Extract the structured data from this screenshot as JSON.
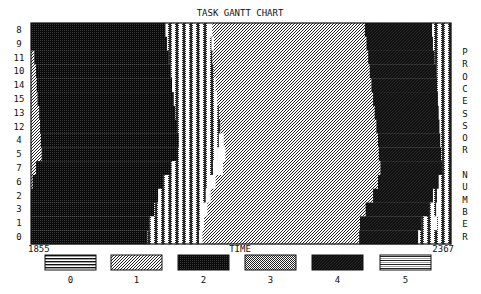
{
  "chart_data": {
    "type": "gantt",
    "title": "TASK GANTT CHART",
    "xlabel": "TIME",
    "ylabel": "PROCESSOR NUMBER",
    "xlim": [
      1855,
      2367
    ],
    "x_tick_labels": [
      "1855",
      "2367"
    ],
    "grid": false,
    "legend_position": "bottom",
    "legend": [
      {
        "task_type": "0",
        "pattern": "horizontal-lines"
      },
      {
        "task_type": "1",
        "pattern": "diagonal-light"
      },
      {
        "task_type": "2",
        "pattern": "dense-dark-checker"
      },
      {
        "task_type": "3",
        "pattern": "stipple-dots"
      },
      {
        "task_type": "4",
        "pattern": "dense-dark-diagonal"
      },
      {
        "task_type": "5",
        "pattern": "double-horizontal-lines"
      }
    ],
    "rows": [
      {
        "processor": "8",
        "segments": [
          [
            1855,
            2019,
            "2"
          ],
          [
            2019,
            2073,
            "3"
          ],
          [
            2073,
            2076,
            "gap"
          ],
          [
            2076,
            2262,
            "1"
          ],
          [
            2262,
            2344,
            "4"
          ],
          [
            2344,
            2367,
            "3"
          ]
        ]
      },
      {
        "processor": "9",
        "segments": [
          [
            1855,
            2021,
            "2"
          ],
          [
            2021,
            2075,
            "3"
          ],
          [
            2075,
            2078,
            "gap"
          ],
          [
            2078,
            2264,
            "1"
          ],
          [
            2264,
            2345,
            "4"
          ],
          [
            2345,
            2367,
            "3"
          ]
        ]
      },
      {
        "processor": "11",
        "segments": [
          [
            1855,
            1859,
            "1"
          ],
          [
            1859,
            2023,
            "2"
          ],
          [
            2023,
            2076,
            "3"
          ],
          [
            2076,
            2266,
            "1"
          ],
          [
            2266,
            2347,
            "4"
          ],
          [
            2347,
            2367,
            "3"
          ]
        ]
      },
      {
        "processor": "10",
        "segments": [
          [
            1855,
            1861,
            "1"
          ],
          [
            1861,
            2025,
            "2"
          ],
          [
            2025,
            2078,
            "3"
          ],
          [
            2078,
            2268,
            "1"
          ],
          [
            2268,
            2349,
            "4"
          ],
          [
            2349,
            2367,
            "3"
          ]
        ]
      },
      {
        "processor": "14",
        "segments": [
          [
            1855,
            1862,
            "1"
          ],
          [
            1862,
            2027,
            "2"
          ],
          [
            2027,
            2080,
            "3"
          ],
          [
            2080,
            2270,
            "1"
          ],
          [
            2270,
            2350,
            "4"
          ],
          [
            2350,
            2367,
            "3"
          ]
        ]
      },
      {
        "processor": "15",
        "segments": [
          [
            1855,
            1863,
            "1"
          ],
          [
            1863,
            2029,
            "2"
          ],
          [
            2029,
            2082,
            "3"
          ],
          [
            2082,
            2272,
            "1"
          ],
          [
            2272,
            2351,
            "4"
          ],
          [
            2351,
            2367,
            "3"
          ]
        ]
      },
      {
        "processor": "13",
        "segments": [
          [
            1855,
            1865,
            "1"
          ],
          [
            1865,
            2031,
            "2"
          ],
          [
            2031,
            2084,
            "3"
          ],
          [
            2084,
            2274,
            "1"
          ],
          [
            2274,
            2352,
            "4"
          ],
          [
            2352,
            2367,
            "3"
          ]
        ]
      },
      {
        "processor": "12",
        "segments": [
          [
            1855,
            1866,
            "1"
          ],
          [
            1866,
            2033,
            "2"
          ],
          [
            2033,
            2086,
            "3"
          ],
          [
            2086,
            2276,
            "1"
          ],
          [
            2276,
            2353,
            "4"
          ],
          [
            2353,
            2367,
            "3"
          ]
        ]
      },
      {
        "processor": "4",
        "segments": [
          [
            1855,
            1867,
            "1"
          ],
          [
            1867,
            2035,
            "2"
          ],
          [
            2035,
            2084,
            "3"
          ],
          [
            2084,
            2090,
            "gap"
          ],
          [
            2090,
            2278,
            "1"
          ],
          [
            2278,
            2354,
            "4"
          ],
          [
            2354,
            2367,
            "3"
          ]
        ]
      },
      {
        "processor": "5",
        "segments": [
          [
            1855,
            1868,
            "1"
          ],
          [
            1868,
            2034,
            "2"
          ],
          [
            2034,
            2082,
            "3"
          ],
          [
            2082,
            2092,
            "gap"
          ],
          [
            2092,
            2279,
            "1"
          ],
          [
            2279,
            2355,
            "4"
          ],
          [
            2355,
            2367,
            "3"
          ]
        ]
      },
      {
        "processor": "7",
        "segments": [
          [
            1855,
            1861,
            "1"
          ],
          [
            1861,
            2026,
            "2"
          ],
          [
            2026,
            2077,
            "3"
          ],
          [
            2077,
            2089,
            "gap"
          ],
          [
            2089,
            2281,
            "1"
          ],
          [
            2281,
            2356,
            "4"
          ],
          [
            2356,
            2367,
            "3"
          ]
        ]
      },
      {
        "processor": "6",
        "segments": [
          [
            1855,
            1857,
            "1"
          ],
          [
            1857,
            2016,
            "2"
          ],
          [
            2016,
            2072,
            "3"
          ],
          [
            2072,
            2080,
            "gap"
          ],
          [
            2080,
            2278,
            "1"
          ],
          [
            2278,
            2352,
            "4"
          ],
          [
            2352,
            2367,
            "3"
          ]
        ]
      },
      {
        "processor": "2",
        "segments": [
          [
            1855,
            2010,
            "2"
          ],
          [
            2010,
            2068,
            "3"
          ],
          [
            2068,
            2074,
            "gap"
          ],
          [
            2074,
            2272,
            "1"
          ],
          [
            2272,
            2345,
            "4"
          ],
          [
            2345,
            2350,
            "3"
          ],
          [
            2350,
            2355,
            "gap"
          ],
          [
            2355,
            2367,
            "3"
          ]
        ]
      },
      {
        "processor": "3",
        "segments": [
          [
            1855,
            2005,
            "2"
          ],
          [
            2005,
            2064,
            "3"
          ],
          [
            2064,
            2070,
            "gap"
          ],
          [
            2070,
            2263,
            "1"
          ],
          [
            2263,
            2340,
            "4"
          ],
          [
            2340,
            2349,
            "3"
          ],
          [
            2349,
            2354,
            "gap"
          ],
          [
            2354,
            2367,
            "3"
          ]
        ]
      },
      {
        "processor": "1",
        "segments": [
          [
            1855,
            1999,
            "2"
          ],
          [
            1999,
            2062,
            "3"
          ],
          [
            2062,
            2066,
            "gap"
          ],
          [
            2066,
            2256,
            "1"
          ],
          [
            2256,
            2331,
            "4"
          ],
          [
            2331,
            2345,
            "3"
          ],
          [
            2345,
            2350,
            "gap"
          ],
          [
            2350,
            2367,
            "3"
          ]
        ]
      },
      {
        "processor": "0",
        "segments": [
          [
            1855,
            1997,
            "2"
          ],
          [
            1997,
            2060,
            "3"
          ],
          [
            2060,
            2064,
            "gap"
          ],
          [
            2064,
            2255,
            "1"
          ],
          [
            2255,
            2327,
            "4"
          ],
          [
            2327,
            2367,
            "3"
          ]
        ]
      }
    ]
  }
}
